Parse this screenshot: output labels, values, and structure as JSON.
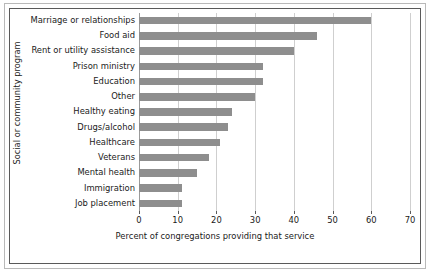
{
  "chart_data": {
    "type": "bar",
    "orientation": "horizontal",
    "title": "",
    "xlabel": "Percent of congregations providing that service",
    "ylabel": "Social or community program",
    "xlim": [
      0,
      70
    ],
    "xticks": [
      0,
      10,
      20,
      30,
      40,
      50,
      60,
      70
    ],
    "grid": true,
    "grid_axis": "x",
    "legend": false,
    "bar_color": "#8e8e8e",
    "categories": [
      "Marriage or relationships",
      "Food aid",
      "Rent or utility assistance",
      "Prison ministry",
      "Education",
      "Other",
      "Healthy eating",
      "Drugs/alcohol",
      "Healthcare",
      "Veterans",
      "Mental health",
      "Immigration",
      "Job placement"
    ],
    "values": [
      60,
      46,
      40,
      32,
      32,
      30,
      24,
      23,
      21,
      18,
      15,
      11,
      11
    ]
  },
  "colors": {
    "bar": "#8e8e8e",
    "grid": "#cfcfcf",
    "axis": "#5a5a5a",
    "frame": "#b9b9b9",
    "text": "#1a1a1a",
    "background": "#ffffff"
  }
}
